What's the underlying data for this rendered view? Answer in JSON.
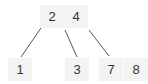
{
  "diagram": {
    "type": "b-tree",
    "root": {
      "keys": [
        "2",
        "4"
      ]
    },
    "children": [
      {
        "keys": [
          "1"
        ]
      },
      {
        "keys": [
          "3"
        ]
      },
      {
        "keys": [
          "7",
          "8"
        ]
      }
    ],
    "edges": [
      {
        "from": "root-left",
        "to": "child-0"
      },
      {
        "from": "root-middle",
        "to": "child-1"
      },
      {
        "from": "root-right",
        "to": "child-2"
      }
    ]
  }
}
